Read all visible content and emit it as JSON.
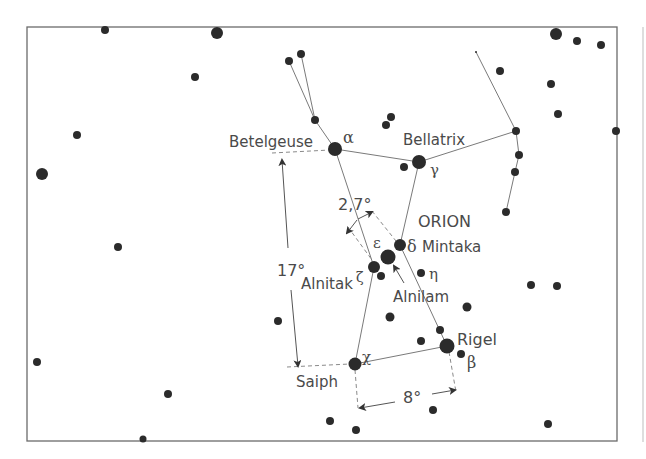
{
  "diagram": {
    "title": "ORION",
    "frame": {
      "x": 27,
      "y": 27,
      "w": 590,
      "h": 414,
      "stroke": "#6b6b6b"
    },
    "colors": {
      "star": "#2b2b2b",
      "line": "#7a7a7a",
      "text": "#4a4a4a"
    },
    "named_stars": [
      {
        "name": "Betelgeuse",
        "greek": "α",
        "x": 335,
        "y": 149,
        "r": 7
      },
      {
        "name": "Bellatrix",
        "greek": "γ",
        "x": 419,
        "y": 162,
        "r": 7
      },
      {
        "name": "Mintaka",
        "greek": "δ",
        "x": 400,
        "y": 245,
        "r": 6
      },
      {
        "name": "Alnilam",
        "greek": "ε",
        "x": 388,
        "y": 257,
        "r": 7
      },
      {
        "name": "Alnitak",
        "greek": "ζ",
        "x": 374,
        "y": 267,
        "r": 6
      },
      {
        "name": "",
        "greek": "η",
        "x": 421,
        "y": 273,
        "r": 4
      },
      {
        "name": "Rigel",
        "greek": "β",
        "x": 447,
        "y": 346,
        "r": 7
      },
      {
        "name": "Saiph",
        "greek": "χ",
        "x": 355,
        "y": 364,
        "r": 6
      }
    ],
    "labels": {
      "constellation": "ORION",
      "betelgeuse": "Betelgeuse",
      "bellatrix": "Bellatrix",
      "mintaka": "Mintaka",
      "alnilam": "Alnilam",
      "alnitak": "Alnitak",
      "rigel": "Rigel",
      "saiph": "Saiph",
      "alpha": "α",
      "gamma": "γ",
      "delta": "δ",
      "epsilon": "ε",
      "zeta": "ζ",
      "eta": "η",
      "beta": "β",
      "chi": "χ"
    },
    "measurements": {
      "belt_width": "2,7°",
      "height": "17°",
      "base_width": "8°"
    }
  }
}
